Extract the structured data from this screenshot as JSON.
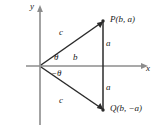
{
  "figure": {
    "type": "coordinate-geometry-diagram",
    "stroke_color": "#2b2b2b",
    "axis_color": "#8c8c8c",
    "background": "#ffffff"
  },
  "axes": {
    "y_label": "y",
    "x_label": "x",
    "origin": {
      "x": 40,
      "y": 66
    }
  },
  "points": {
    "p": {
      "label": "P(b, a)",
      "x": 103,
      "y": 21
    },
    "q": {
      "label": "Q(b, −a)",
      "x": 103,
      "y": 110
    }
  },
  "segment_labels": {
    "c_upper": "c",
    "c_lower": "c",
    "a_upper": "a",
    "a_lower": "a",
    "b": "b"
  },
  "angle_labels": {
    "theta": "θ",
    "negative_theta": "−θ"
  }
}
